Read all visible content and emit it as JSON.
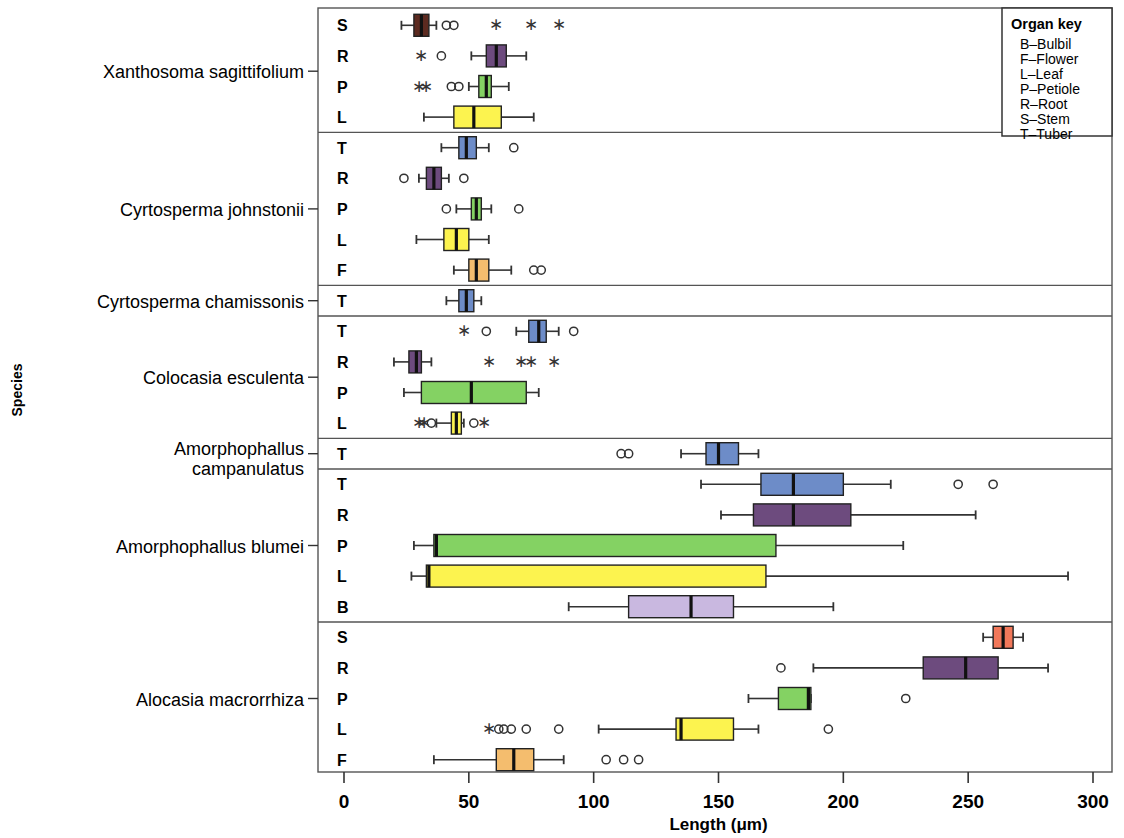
{
  "chart_data": {
    "type": "box",
    "title": "",
    "xlabel": "Length (μm)",
    "ylabel": "Species",
    "xlim": [
      0,
      300
    ],
    "xticks": [
      0,
      50,
      100,
      150,
      200,
      250,
      300
    ],
    "xticklabels": [
      "0",
      "50",
      "100",
      "150",
      "200",
      "250",
      "300"
    ],
    "grid": false,
    "legend": {
      "title": "Organ key",
      "position": "top-right",
      "entries": [
        {
          "code": "B",
          "label": "B–Bulbil"
        },
        {
          "code": "F",
          "label": "F–Flower"
        },
        {
          "code": "L",
          "label": "L–Leaf"
        },
        {
          "code": "P",
          "label": "P–Petiole"
        },
        {
          "code": "R",
          "label": "R–Root"
        },
        {
          "code": "S",
          "label": "S–Stem"
        },
        {
          "code": "T",
          "label": "T–Tuber"
        }
      ]
    },
    "organ_colors": {
      "B": "#c9b8e0",
      "F": "#f4bd6e",
      "L": "#fcf34f",
      "P": "#84d263",
      "R": "#6d4b7e",
      "S": "#f2785a",
      "T": "#6d8cc8"
    },
    "groups": [
      {
        "species": "Xanthosoma sagittifolium",
        "rows": [
          {
            "organ": "S",
            "color": "#5c2a20",
            "whisker_low": 23,
            "q1": 28,
            "median": 31,
            "q3": 34,
            "whisker_high": 37,
            "outliers_circle": [
              41,
              44
            ],
            "outliers_star": [
              61,
              75,
              86
            ]
          },
          {
            "organ": "R",
            "color": "#6d4b7e",
            "whisker_low": 51,
            "q1": 57,
            "median": 61,
            "q3": 65,
            "whisker_high": 73,
            "outliers_circle": [
              39
            ],
            "outliers_star": [
              31
            ]
          },
          {
            "organ": "P",
            "color": "#84d263",
            "whisker_low": 50,
            "q1": 54,
            "median": 57,
            "q3": 59,
            "whisker_high": 66,
            "outliers_circle": [
              43,
              46
            ],
            "outliers_star": [
              30,
              33
            ]
          },
          {
            "organ": "L",
            "color": "#fcf34f",
            "whisker_low": 32,
            "q1": 44,
            "median": 52,
            "q3": 63,
            "whisker_high": 76,
            "outliers_circle": [],
            "outliers_star": []
          }
        ]
      },
      {
        "species": "Cyrtosperma johnstonii",
        "rows": [
          {
            "organ": "T",
            "color": "#6d8cc8",
            "whisker_low": 39,
            "q1": 46,
            "median": 49,
            "q3": 53,
            "whisker_high": 58,
            "outliers_circle": [
              68
            ],
            "outliers_star": []
          },
          {
            "organ": "R",
            "color": "#6d4b7e",
            "whisker_low": 30,
            "q1": 33,
            "median": 36,
            "q3": 39,
            "whisker_high": 42,
            "outliers_circle": [
              24,
              48
            ],
            "outliers_star": []
          },
          {
            "organ": "P",
            "color": "#84d263",
            "whisker_low": 45,
            "q1": 51,
            "median": 53,
            "q3": 55,
            "whisker_high": 59,
            "outliers_circle": [
              41,
              70
            ],
            "outliers_star": []
          },
          {
            "organ": "L",
            "color": "#fcf34f",
            "whisker_low": 29,
            "q1": 40,
            "median": 45,
            "q3": 50,
            "whisker_high": 58,
            "outliers_circle": [],
            "outliers_star": []
          },
          {
            "organ": "F",
            "color": "#f4bd6e",
            "whisker_low": 44,
            "q1": 50,
            "median": 53,
            "q3": 58,
            "whisker_high": 67,
            "outliers_circle": [
              76,
              79
            ],
            "outliers_star": []
          }
        ]
      },
      {
        "species": "Cyrtosperma chamissonis",
        "rows": [
          {
            "organ": "T",
            "color": "#6d8cc8",
            "whisker_low": 41,
            "q1": 46,
            "median": 49,
            "q3": 52,
            "whisker_high": 55,
            "outliers_circle": [],
            "outliers_star": []
          }
        ]
      },
      {
        "species": "Colocasia esculenta",
        "rows": [
          {
            "organ": "T",
            "color": "#6d8cc8",
            "whisker_low": 69,
            "q1": 74,
            "median": 78,
            "q3": 81,
            "whisker_high": 86,
            "outliers_circle": [
              57,
              92
            ],
            "outliers_star": [
              48
            ]
          },
          {
            "organ": "R",
            "color": "#6d4b7e",
            "whisker_low": 20,
            "q1": 26,
            "median": 29,
            "q3": 31,
            "whisker_high": 35,
            "outliers_circle": [],
            "outliers_star": [
              58,
              71,
              75,
              84
            ]
          },
          {
            "organ": "P",
            "color": "#84d263",
            "whisker_low": 24,
            "q1": 31,
            "median": 51,
            "q3": 73,
            "whisker_high": 78,
            "outliers_circle": [],
            "outliers_star": []
          },
          {
            "organ": "L",
            "color": "#fcf34f",
            "whisker_low": 37,
            "q1": 43,
            "median": 45,
            "q3": 47,
            "whisker_high": 48,
            "outliers_circle": [
              35,
              52
            ],
            "outliers_star": [
              30,
              32,
              56
            ]
          }
        ]
      },
      {
        "species": "Amorphophallus campanulatus",
        "rows": [
          {
            "organ": "T",
            "color": "#6d8cc8",
            "whisker_low": 135,
            "q1": 145,
            "median": 150,
            "q3": 158,
            "whisker_high": 166,
            "outliers_circle": [
              111,
              114
            ],
            "outliers_star": []
          }
        ]
      },
      {
        "species": "Amorphophallus blumei",
        "rows": [
          {
            "organ": "T",
            "color": "#6d8cc8",
            "whisker_low": 143,
            "q1": 167,
            "median": 180,
            "q3": 200,
            "whisker_high": 219,
            "outliers_circle": [
              246,
              260
            ],
            "outliers_star": []
          },
          {
            "organ": "R",
            "color": "#6d4b7e",
            "whisker_low": 151,
            "q1": 164,
            "median": 180,
            "q3": 203,
            "whisker_high": 253,
            "outliers_circle": [],
            "outliers_star": []
          },
          {
            "organ": "P",
            "color": "#84d263",
            "whisker_low": 28,
            "q1": 36,
            "median": 37,
            "q3": 173,
            "whisker_high": 224,
            "outliers_circle": [],
            "outliers_star": []
          },
          {
            "organ": "L",
            "color": "#fcf34f",
            "whisker_low": 27,
            "q1": 33,
            "median": 34,
            "q3": 169,
            "whisker_high": 290,
            "outliers_circle": [],
            "outliers_star": []
          },
          {
            "organ": "B",
            "color": "#c9b8e0",
            "whisker_low": 90,
            "q1": 114,
            "median": 139,
            "q3": 156,
            "whisker_high": 196,
            "outliers_circle": [],
            "outliers_star": []
          }
        ]
      },
      {
        "species": "Alocasia macrorrhiza",
        "rows": [
          {
            "organ": "S",
            "color": "#f2785a",
            "whisker_low": 256,
            "q1": 260,
            "median": 264,
            "q3": 268,
            "whisker_high": 272,
            "outliers_circle": [],
            "outliers_star": []
          },
          {
            "organ": "R",
            "color": "#6d4b7e",
            "whisker_low": 188,
            "q1": 232,
            "median": 249,
            "q3": 262,
            "whisker_high": 282,
            "outliers_circle": [
              175
            ],
            "outliers_star": []
          },
          {
            "organ": "P",
            "color": "#84d263",
            "whisker_low": 162,
            "q1": 174,
            "median": 186,
            "q3": 187,
            "whisker_high": 187,
            "outliers_circle": [
              225
            ],
            "outliers_star": []
          },
          {
            "organ": "L",
            "color": "#fcf34f",
            "whisker_low": 102,
            "q1": 133,
            "median": 135,
            "q3": 156,
            "whisker_high": 166,
            "outliers_circle": [
              62,
              64,
              67,
              73,
              86,
              194
            ],
            "outliers_star": [
              58
            ]
          },
          {
            "organ": "F",
            "color": "#f4bd6e",
            "whisker_low": 36,
            "q1": 61,
            "median": 68,
            "q3": 76,
            "whisker_high": 88,
            "outliers_circle": [
              105,
              112,
              118
            ],
            "outliers_star": []
          }
        ]
      }
    ]
  }
}
